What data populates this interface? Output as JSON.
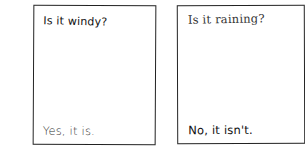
{
  "comic": {
    "panels": [
      {
        "question": "Is it windy?",
        "answer": "Yes, it is."
      },
      {
        "question": "Is it raining?",
        "answer": "No, it isn't."
      }
    ]
  },
  "colors": {
    "background": "#ffffff",
    "ink": "#1a1a1a",
    "border": "#222222"
  }
}
